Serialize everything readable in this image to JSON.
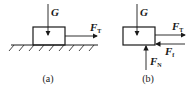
{
  "figure_a": {
    "caption": "(a)",
    "weight_label": "G",
    "force_label": "F",
    "force_subscript": "T"
  },
  "figure_b": {
    "caption": "(b)",
    "weight_label": "G",
    "tension_label": "F",
    "tension_subscript": "T",
    "friction_label": "F",
    "friction_subscript": "f",
    "normal_label": "F",
    "normal_subscript": "N"
  },
  "colors": {
    "stroke": "#1a1a1a",
    "background": "#ffffff"
  }
}
